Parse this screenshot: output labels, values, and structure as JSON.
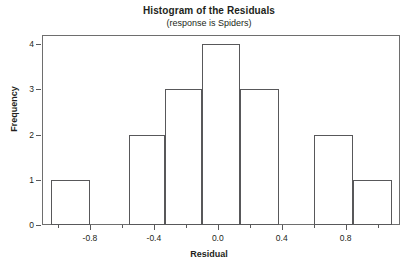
{
  "chart_data": {
    "type": "bar",
    "title": "Histogram of the Residuals",
    "subtitle": "(response is Spiders)",
    "xlabel": "Residual",
    "ylabel": "Frequency",
    "xlim": [
      -1.1,
      1.14
    ],
    "ylim": [
      0,
      4.2
    ],
    "grid": false,
    "legend": null,
    "bin_width": 0.245,
    "x_ticks": [
      -0.8,
      -0.4,
      0.0,
      0.4,
      0.8
    ],
    "x_tick_labels": [
      "-0.8",
      "-0.4",
      "0.0",
      "0.4",
      "0.8"
    ],
    "x_minor_ticks": [
      -1.0,
      -0.6,
      -0.2,
      0.2,
      0.6,
      1.0
    ],
    "y_ticks": [
      0,
      1,
      2,
      3,
      4
    ],
    "y_tick_labels": [
      "0",
      "1",
      "2",
      "3",
      "4"
    ],
    "bins": [
      {
        "left": -1.045,
        "right": -0.8,
        "center": -0.92,
        "value": 1
      },
      {
        "left": -0.8,
        "right": -0.555,
        "center": -0.68,
        "value": 0
      },
      {
        "left": -0.555,
        "right": -0.33,
        "center": -0.44,
        "value": 2
      },
      {
        "left": -0.33,
        "right": -0.1,
        "center": -0.22,
        "value": 3
      },
      {
        "left": -0.1,
        "right": 0.14,
        "center": 0.02,
        "value": 4
      },
      {
        "left": 0.14,
        "right": 0.385,
        "center": 0.26,
        "value": 3
      },
      {
        "left": 0.385,
        "right": 0.6,
        "center": 0.49,
        "value": 0
      },
      {
        "left": 0.6,
        "right": 0.845,
        "center": 0.72,
        "value": 2
      },
      {
        "left": 0.845,
        "right": 1.09,
        "center": 0.97,
        "value": 1
      }
    ],
    "categories": [
      "-0.92",
      "-0.68",
      "-0.44",
      "-0.22",
      "0.02",
      "0.26",
      "0.49",
      "0.72",
      "0.97"
    ],
    "values": [
      1,
      0,
      2,
      3,
      4,
      3,
      0,
      2,
      1
    ]
  },
  "style": {
    "bar_fill": "#ffffff",
    "bar_border": "#58585a",
    "frame_border": "#6e6e6e",
    "text_color": "#231f20",
    "background": "#ffffff"
  }
}
